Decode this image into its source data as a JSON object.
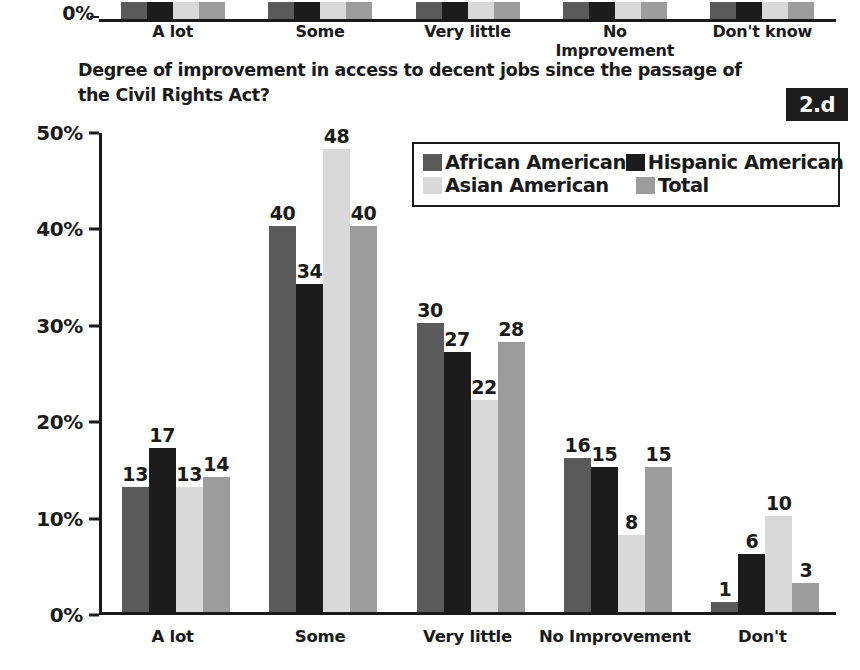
{
  "figure": {
    "badge": "2.d",
    "title": "Degree of improvement in access to decent jobs since the passage of the Civil Rights Act?"
  },
  "top_partial_chart": {
    "y_axis_label": "0%",
    "categories": [
      "A lot",
      "Some",
      "Very little",
      "No Improvement",
      "Don't know"
    ]
  },
  "legend": {
    "items": [
      {
        "label": "African American",
        "color": "#5a5a5a"
      },
      {
        "label": "Hispanic American",
        "color": "#1c1c1c"
      },
      {
        "label": "Asian American",
        "color": "#d9d9d9"
      },
      {
        "label": "Total",
        "color": "#9d9d9d"
      }
    ]
  },
  "chart_data": {
    "type": "bar",
    "title": "Degree of improvement in access to decent jobs since the passage of the Civil Rights Act?",
    "xlabel": "",
    "ylabel": "",
    "ylim": [
      0,
      50
    ],
    "y_tick_labels": [
      "0%",
      "10%",
      "20%",
      "30%",
      "40%",
      "50%"
    ],
    "y_ticks": [
      0,
      10,
      20,
      30,
      40,
      50
    ],
    "grid": false,
    "legend_position": "upper-right-inside",
    "value_labels": true,
    "categories": [
      "A lot",
      "Some",
      "Very little",
      "No Improvement",
      "Don't"
    ],
    "series": [
      {
        "name": "African American",
        "color": "#5a5a5a",
        "values": [
          13,
          40,
          30,
          16,
          1
        ]
      },
      {
        "name": "Hispanic American",
        "color": "#1c1c1c",
        "values": [
          17,
          34,
          27,
          15,
          6
        ]
      },
      {
        "name": "Asian American",
        "color": "#d9d9d9",
        "values": [
          13,
          48,
          22,
          8,
          10
        ]
      },
      {
        "name": "Total",
        "color": "#9d9d9d",
        "values": [
          14,
          40,
          28,
          15,
          3
        ]
      }
    ]
  }
}
